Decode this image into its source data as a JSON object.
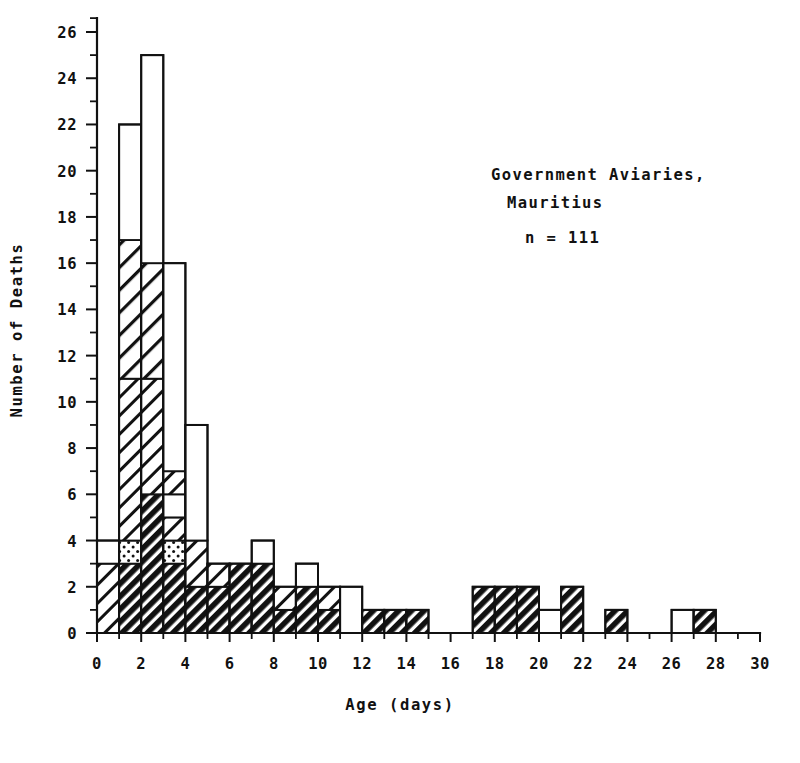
{
  "chart_data": {
    "type": "bar",
    "title": "",
    "xlabel": "Age (days)",
    "ylabel": "Number of Deaths",
    "xlim": [
      0,
      30
    ],
    "ylim": [
      0,
      26
    ],
    "grid": false,
    "bin_width": 1,
    "x_tick_step": 1,
    "x_label_step": 2,
    "y_tick_step": 1,
    "y_label_step": 2,
    "x_tick_labels": [
      "0",
      "2",
      "4",
      "6",
      "8",
      "10",
      "12",
      "14",
      "16",
      "18",
      "20",
      "22",
      "24",
      "26",
      "28",
      "30"
    ],
    "y_tick_labels": [
      "0",
      "2",
      "4",
      "6",
      "8",
      "10",
      "12",
      "14",
      "16",
      "18",
      "20",
      "22",
      "24",
      "26"
    ],
    "annotations": [
      {
        "id": "location",
        "line1": "Government Aviaries,",
        "line2": "Mauritius"
      },
      {
        "id": "sample-size",
        "text": "n = 111"
      }
    ],
    "legend": {
      "position": "none",
      "entries": [
        {
          "key": "dark-hatch",
          "label": ""
        },
        {
          "key": "light-hatch",
          "label": ""
        },
        {
          "key": "stipple",
          "label": ""
        },
        {
          "key": "open",
          "label": ""
        }
      ]
    },
    "categories": [
      "0-1",
      "1-2",
      "2-3",
      "3-4",
      "4-5",
      "5-6",
      "6-7",
      "7-8",
      "8-9",
      "9-10",
      "10-11",
      "11-12",
      "12-13",
      "13-14",
      "14-15",
      "15-16",
      "16-17",
      "17-18",
      "18-19",
      "19-20",
      "20-21",
      "21-22",
      "22-23",
      "23-24",
      "24-25",
      "25-26",
      "26-27",
      "27-28",
      "28-29",
      "29-30"
    ],
    "values": [
      4,
      22,
      25,
      16,
      9,
      3,
      3,
      4,
      2,
      3,
      2,
      2,
      1,
      1,
      1,
      0,
      0,
      2,
      2,
      2,
      1,
      2,
      0,
      1,
      0,
      0,
      1,
      1,
      0,
      0
    ],
    "bins": [
      {
        "x0": 0,
        "x1": 1,
        "total": 4,
        "segments": [
          {
            "pattern": "light-hatch",
            "from": 0,
            "to": 3
          },
          {
            "pattern": "open",
            "from": 3,
            "to": 4
          }
        ]
      },
      {
        "x0": 1,
        "x1": 2,
        "total": 22,
        "segments": [
          {
            "pattern": "dark-hatch",
            "from": 0,
            "to": 3
          },
          {
            "pattern": "stipple",
            "from": 3,
            "to": 4
          },
          {
            "pattern": "light-hatch",
            "from": 4,
            "to": 11
          },
          {
            "pattern": "light-hatch-wide",
            "from": 11,
            "to": 17
          },
          {
            "pattern": "open",
            "from": 17,
            "to": 22
          }
        ]
      },
      {
        "x0": 2,
        "x1": 3,
        "total": 25,
        "segments": [
          {
            "pattern": "dark-hatch",
            "from": 0,
            "to": 6
          },
          {
            "pattern": "light-hatch",
            "from": 6,
            "to": 11
          },
          {
            "pattern": "light-hatch-wide",
            "from": 11,
            "to": 16
          },
          {
            "pattern": "open",
            "from": 16,
            "to": 25
          }
        ]
      },
      {
        "x0": 3,
        "x1": 4,
        "total": 16,
        "segments": [
          {
            "pattern": "dark-hatch",
            "from": 0,
            "to": 3
          },
          {
            "pattern": "stipple",
            "from": 3,
            "to": 4
          },
          {
            "pattern": "light-hatch",
            "from": 4,
            "to": 5
          },
          {
            "pattern": "open",
            "from": 5,
            "to": 6
          },
          {
            "pattern": "light-hatch",
            "from": 6,
            "to": 7
          },
          {
            "pattern": "open",
            "from": 7,
            "to": 16
          }
        ]
      },
      {
        "x0": 4,
        "x1": 5,
        "total": 9,
        "segments": [
          {
            "pattern": "dark-hatch",
            "from": 0,
            "to": 2
          },
          {
            "pattern": "light-hatch",
            "from": 2,
            "to": 4
          },
          {
            "pattern": "open",
            "from": 4,
            "to": 9
          }
        ]
      },
      {
        "x0": 5,
        "x1": 6,
        "total": 3,
        "segments": [
          {
            "pattern": "dark-hatch",
            "from": 0,
            "to": 2
          },
          {
            "pattern": "light-hatch",
            "from": 2,
            "to": 3
          }
        ]
      },
      {
        "x0": 6,
        "x1": 7,
        "total": 3,
        "segments": [
          {
            "pattern": "dark-hatch",
            "from": 0,
            "to": 3
          }
        ]
      },
      {
        "x0": 7,
        "x1": 8,
        "total": 4,
        "segments": [
          {
            "pattern": "dark-hatch",
            "from": 0,
            "to": 3
          },
          {
            "pattern": "open",
            "from": 3,
            "to": 4
          }
        ]
      },
      {
        "x0": 8,
        "x1": 9,
        "total": 2,
        "segments": [
          {
            "pattern": "dark-hatch",
            "from": 0,
            "to": 1
          },
          {
            "pattern": "light-hatch",
            "from": 1,
            "to": 2
          }
        ]
      },
      {
        "x0": 9,
        "x1": 10,
        "total": 3,
        "segments": [
          {
            "pattern": "dark-hatch",
            "from": 0,
            "to": 2
          },
          {
            "pattern": "open",
            "from": 2,
            "to": 3
          }
        ]
      },
      {
        "x0": 10,
        "x1": 11,
        "total": 2,
        "segments": [
          {
            "pattern": "dark-hatch",
            "from": 0,
            "to": 1
          },
          {
            "pattern": "light-hatch",
            "from": 1,
            "to": 2
          }
        ]
      },
      {
        "x0": 11,
        "x1": 12,
        "total": 2,
        "segments": [
          {
            "pattern": "open",
            "from": 0,
            "to": 2
          }
        ]
      },
      {
        "x0": 12,
        "x1": 13,
        "total": 1,
        "segments": [
          {
            "pattern": "dark-hatch",
            "from": 0,
            "to": 1
          }
        ]
      },
      {
        "x0": 13,
        "x1": 14,
        "total": 1,
        "segments": [
          {
            "pattern": "dark-hatch",
            "from": 0,
            "to": 1
          }
        ]
      },
      {
        "x0": 14,
        "x1": 15,
        "total": 1,
        "segments": [
          {
            "pattern": "dark-hatch",
            "from": 0,
            "to": 1
          }
        ]
      },
      {
        "x0": 17,
        "x1": 18,
        "total": 2,
        "segments": [
          {
            "pattern": "dark-hatch",
            "from": 0,
            "to": 2
          }
        ]
      },
      {
        "x0": 18,
        "x1": 19,
        "total": 2,
        "segments": [
          {
            "pattern": "dark-hatch",
            "from": 0,
            "to": 2
          }
        ]
      },
      {
        "x0": 19,
        "x1": 20,
        "total": 2,
        "segments": [
          {
            "pattern": "dark-hatch",
            "from": 0,
            "to": 2
          }
        ]
      },
      {
        "x0": 20,
        "x1": 21,
        "total": 1,
        "segments": [
          {
            "pattern": "open",
            "from": 0,
            "to": 1
          }
        ]
      },
      {
        "x0": 21,
        "x1": 22,
        "total": 2,
        "segments": [
          {
            "pattern": "dark-hatch",
            "from": 0,
            "to": 2
          }
        ]
      },
      {
        "x0": 23,
        "x1": 24,
        "total": 1,
        "segments": [
          {
            "pattern": "dark-hatch",
            "from": 0,
            "to": 1
          }
        ]
      },
      {
        "x0": 26,
        "x1": 27,
        "total": 1,
        "segments": [
          {
            "pattern": "open",
            "from": 0,
            "to": 1
          }
        ]
      },
      {
        "x0": 27,
        "x1": 28,
        "total": 1,
        "segments": [
          {
            "pattern": "dark-hatch",
            "from": 0,
            "to": 1
          }
        ]
      }
    ]
  },
  "colors": {
    "ink": "#111111",
    "background": "#ffffff"
  },
  "geometry": {
    "plot_left": 97,
    "plot_right": 760,
    "plot_bottom": 633,
    "plot_top": 32
  }
}
